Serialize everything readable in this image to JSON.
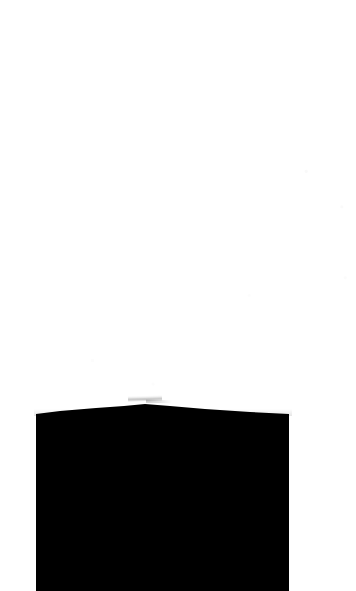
{
  "page": {
    "width": 356,
    "height": 591,
    "background_color": "#ffffff",
    "description": "Scanned page: blank white field with a large solid black region in the lower portion"
  },
  "ink_block": {
    "name": "black-region",
    "fill_color": "#000000",
    "left_edge_x": 36,
    "right_edge_x": 289,
    "top_edge_left_y": 413,
    "top_edge_apex_x": 145,
    "top_edge_apex_y": 404,
    "top_edge_right_y": 413,
    "bleeds_off_bottom": true,
    "outline_path": "M 36,414 L 60,411 L 96,408 L 124,406 L 145,404 L 170,406 L 205,409 L 250,412 L 289,414 L 289,591 L 36,591 Z"
  },
  "artifacts": {
    "edge_wisp_color": "#595959",
    "edge_wisp_label": "thin grey scan wisp above apex"
  }
}
